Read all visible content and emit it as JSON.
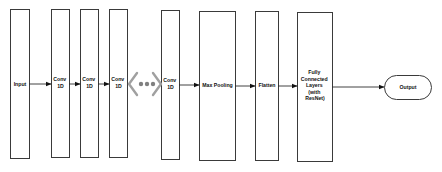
{
  "diagram": {
    "nodes": [
      {
        "id": "input",
        "label": [
          "Input"
        ]
      },
      {
        "id": "conv1",
        "label": [
          "Conv",
          "1D"
        ]
      },
      {
        "id": "conv2",
        "label": [
          "Conv",
          "1D"
        ]
      },
      {
        "id": "conv3",
        "label": [
          "Conv",
          "1D"
        ]
      },
      {
        "id": "ellipsis",
        "label": [
          "..."
        ]
      },
      {
        "id": "conv4",
        "label": [
          "Conv",
          "1D"
        ]
      },
      {
        "id": "maxpool",
        "label": [
          "Max Pooling"
        ]
      },
      {
        "id": "flatten",
        "label": [
          "Flatten"
        ]
      },
      {
        "id": "fc",
        "label": [
          "Fully",
          "Connected",
          "Layers",
          "(with",
          "ResNet)"
        ]
      },
      {
        "id": "output",
        "label": [
          "Output"
        ]
      }
    ],
    "edges": [
      [
        "input",
        "conv1"
      ],
      [
        "conv1",
        "conv2"
      ],
      [
        "conv2",
        "conv3"
      ],
      [
        "conv4",
        "maxpool"
      ],
      [
        "maxpool",
        "flatten"
      ],
      [
        "flatten",
        "fc"
      ],
      [
        "fc",
        "output"
      ]
    ],
    "colors": {
      "stroke": "#3a3a3a",
      "ellipsis": "#a0a0a0",
      "dots": "#808080"
    }
  }
}
